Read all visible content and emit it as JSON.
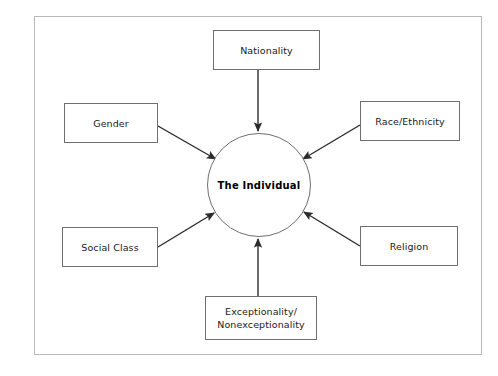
{
  "diagram": {
    "title_text": "",
    "frame": {
      "border_color": "#b9b9b9"
    },
    "center": {
      "label": "The Individual",
      "shape": "circle",
      "border_color": "#6f6f6f",
      "fill": "#ffffff"
    },
    "nodes": [
      {
        "id": "nationality",
        "label": "Nationality",
        "lines": [
          "Nationality"
        ],
        "position": "top"
      },
      {
        "id": "gender",
        "label": "Gender",
        "lines": [
          "Gender"
        ],
        "position": "upper-left"
      },
      {
        "id": "race-ethnicity",
        "label": "Race/Ethnicity",
        "lines": [
          "Race/Ethnicity"
        ],
        "position": "upper-right"
      },
      {
        "id": "social-class",
        "label": "Social Class",
        "lines": [
          "Social Class"
        ],
        "position": "lower-left"
      },
      {
        "id": "religion",
        "label": "Religion",
        "lines": [
          "Religion"
        ],
        "position": "lower-right"
      },
      {
        "id": "exceptionality",
        "label": "Exceptionality/ Nonexceptionality",
        "lines": [
          "Exceptionality/",
          "Nonexceptionality"
        ],
        "position": "bottom"
      }
    ],
    "arrows": [
      {
        "from": "nationality",
        "to": "center",
        "direction": "down"
      },
      {
        "from": "gender",
        "to": "center",
        "direction": "down-right"
      },
      {
        "from": "race-ethnicity",
        "to": "center",
        "direction": "down-left"
      },
      {
        "from": "social-class",
        "to": "center",
        "direction": "up-right"
      },
      {
        "from": "religion",
        "to": "center",
        "direction": "up-left"
      },
      {
        "from": "exceptionality",
        "to": "center",
        "direction": "up"
      }
    ],
    "colors": {
      "arrow": "#2b2b2b",
      "box_border": "#6f6f6f",
      "frame_border": "#b9b9b9",
      "text": "#1a1a1a",
      "background": "#ffffff"
    }
  }
}
